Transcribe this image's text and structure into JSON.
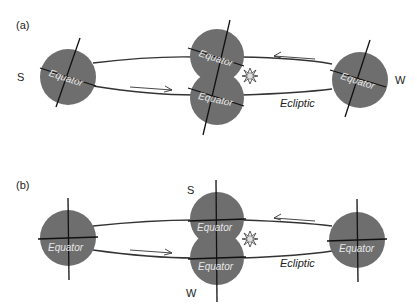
{
  "panels": [
    {
      "label": "(a)",
      "direction_left": "S",
      "direction_right": "W",
      "equator_label": "Equator",
      "ecliptic_label": "Ecliptic",
      "axis_style": "tilted"
    },
    {
      "label": "(b)",
      "direction_top": "S",
      "direction_bottom": "W",
      "equator_label": "Equator",
      "ecliptic_label": "Ecliptic",
      "axis_style": "upright"
    }
  ],
  "icons": {
    "sun": "sun-icon",
    "arrow_forward": "arrow-right-icon",
    "arrow_back": "arrow-left-icon"
  },
  "colors": {
    "globe": "#6e6e6e",
    "line": "#111111",
    "background": "#ffffff"
  }
}
